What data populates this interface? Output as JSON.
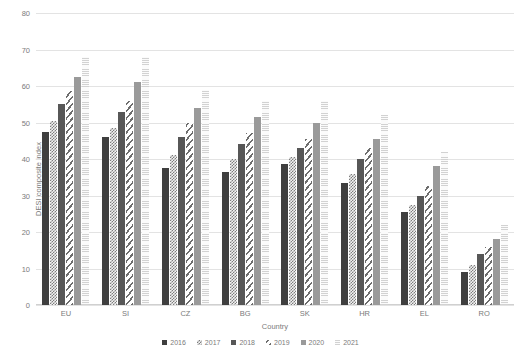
{
  "chart_data": {
    "type": "bar",
    "title": "",
    "xlabel": "Country",
    "ylabel": "DESI composite index",
    "categories": [
      "EU",
      "SI",
      "CZ",
      "BG",
      "SK",
      "HR",
      "EL",
      "RO"
    ],
    "series": [
      {
        "name": "2016",
        "values": [
          47.5,
          46.0,
          37.5,
          36.5,
          38.5,
          33.5,
          25.5,
          9.0
        ]
      },
      {
        "name": "2017",
        "values": [
          50.5,
          48.5,
          41.0,
          40.0,
          40.5,
          36.0,
          27.5,
          11.0
        ]
      },
      {
        "name": "2018",
        "values": [
          55.0,
          53.0,
          46.0,
          44.0,
          43.0,
          40.0,
          30.0,
          14.0
        ]
      },
      {
        "name": "2019",
        "values": [
          58.5,
          56.0,
          50.0,
          47.0,
          45.5,
          43.0,
          32.5,
          16.0
        ]
      },
      {
        "name": "2020",
        "values": [
          62.5,
          61.0,
          54.0,
          51.5,
          50.0,
          45.5,
          38.0,
          18.0
        ]
      },
      {
        "name": "2021",
        "values": [
          68.0,
          68.0,
          59.0,
          56.0,
          56.0,
          52.0,
          42.0,
          22.0
        ]
      }
    ],
    "ylim": [
      0,
      80
    ],
    "yticks": [
      0,
      10,
      20,
      30,
      40,
      50,
      60,
      70,
      80
    ],
    "grid": true,
    "legend_position": "bottom",
    "colors": {
      "2016": "#3f3f3f",
      "2017": "#f2f2f2",
      "2018": "#575757",
      "2019": "#ffffff",
      "2020": "#9a9a9a",
      "2021": "#fbfbfb",
      "gridline": "#e3e3e3",
      "text": "#7b7b7b"
    }
  }
}
